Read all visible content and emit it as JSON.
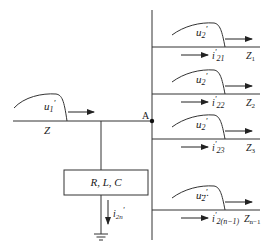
{
  "diagram": {
    "title": "",
    "node": {
      "label": "A"
    },
    "incoming_line": {
      "impedance": "Z",
      "wave": {
        "label_main": "u",
        "label_sub": "1",
        "label_prime": "'"
      }
    },
    "shunt": {
      "box_label": "R, L, C",
      "current": {
        "label_main": "i",
        "label_sub": "2n",
        "label_prime": "'"
      }
    },
    "ellipsis": "...",
    "branches": [
      {
        "wave": "u",
        "wave_sub": "2",
        "wave_prime": "'",
        "current_main": "i",
        "current_prime": "'",
        "current_sub": "21",
        "impedance": "Z",
        "impedance_sub": "1"
      },
      {
        "wave": "u",
        "wave_sub": "2",
        "wave_prime": "'",
        "current_main": "i",
        "current_prime": "'",
        "current_sub": "22",
        "impedance": "Z",
        "impedance_sub": "2"
      },
      {
        "wave": "u",
        "wave_sub": "2",
        "wave_prime": "'",
        "current_main": "i",
        "current_prime": "'",
        "current_sub": "23",
        "impedance": "Z",
        "impedance_sub": "3"
      },
      {
        "wave": "u",
        "wave_sub": "2",
        "wave_prime": "'",
        "current_main": "i",
        "current_prime": "'",
        "current_sub": "2(n−1)",
        "impedance": "Z",
        "impedance_sub": "n−1"
      }
    ]
  }
}
